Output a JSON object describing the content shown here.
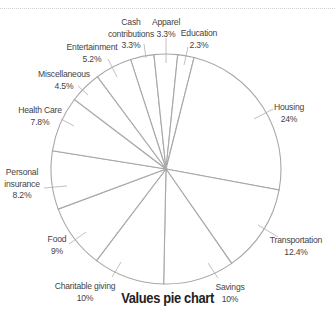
{
  "chart_data": {
    "type": "pie",
    "title": "Values pie chart",
    "start_angle_deg": -17.9,
    "direction": "clockwise",
    "slices": [
      {
        "label": "Cash contributions",
        "lines": [
          "Cash",
          "contributions",
          "3.3%"
        ],
        "value": 3.3,
        "text_x": 131,
        "text_y": 25,
        "leader": [
          [
            144,
            44
          ],
          [
            146,
            58
          ]
        ]
      },
      {
        "label": "Apparel",
        "lines": [
          "Apparel",
          "3.3%"
        ],
        "value": 3.3,
        "text_x": 166,
        "text_y": 25,
        "leader": [
          [
            166,
            38
          ],
          [
            166,
            63
          ]
        ]
      },
      {
        "label": "Education",
        "lines": [
          "Education",
          "2.3%"
        ],
        "value": 2.3,
        "text_x": 199,
        "text_y": 36,
        "leader": [
          [
            188,
            47
          ],
          [
            184,
            65
          ]
        ]
      },
      {
        "label": "Housing",
        "lines": [
          "Housing",
          "24%"
        ],
        "value": 24,
        "text_x": 289,
        "text_y": 110,
        "leader": [
          [
            273,
            109
          ],
          [
            254,
            119
          ]
        ]
      },
      {
        "label": "Transportation",
        "lines": [
          "Transportation",
          "12.4%"
        ],
        "value": 12.4,
        "text_x": 296,
        "text_y": 243,
        "leader": [
          [
            278,
            237
          ],
          [
            258,
            225
          ]
        ]
      },
      {
        "label": "Savings",
        "lines": [
          "Savings",
          "10%"
        ],
        "value": 10,
        "text_x": 230,
        "text_y": 290,
        "leader": [
          [
            218,
            278
          ],
          [
            208,
            263
          ]
        ]
      },
      {
        "label": "Charitable giving",
        "lines": [
          "Charitable giving",
          "10%"
        ],
        "value": 10,
        "text_x": 85,
        "text_y": 289,
        "leader": [
          [
            112,
            277
          ],
          [
            121,
            262
          ]
        ]
      },
      {
        "label": "Food",
        "lines": [
          "Food",
          "9%"
        ],
        "value": 9,
        "text_x": 57,
        "text_y": 242,
        "leader": [
          [
            69,
            244
          ],
          [
            86,
            232
          ]
        ]
      },
      {
        "label": "Personal insurance",
        "lines": [
          "Personal",
          "insurance",
          "8.2%"
        ],
        "value": 8.2,
        "text_x": 22,
        "text_y": 175,
        "leader": [
          [
            44,
            188
          ],
          [
            67,
            186
          ]
        ]
      },
      {
        "label": "Health Care",
        "lines": [
          "Health Care",
          "7.8%"
        ],
        "value": 7.8,
        "text_x": 40,
        "text_y": 113,
        "leader": [
          [
            61,
            119
          ],
          [
            74,
            126
          ]
        ]
      },
      {
        "label": "Miscellaneous",
        "lines": [
          "Miscellaneous",
          "4.5%"
        ],
        "value": 4.5,
        "text_x": 64,
        "text_y": 77,
        "leader": [
          [
            78,
            86
          ],
          [
            88,
            95
          ]
        ]
      },
      {
        "label": "Entertainment",
        "lines": [
          "Entertainment",
          "5.2%"
        ],
        "value": 5.2,
        "text_x": 92,
        "text_y": 50,
        "leader": [
          [
            108,
            59
          ],
          [
            117,
            77
          ]
        ]
      }
    ],
    "center": [
      166,
      169
    ],
    "radius": 115,
    "stroke_color": "#a8a8a8",
    "fill_color": "#ffffff",
    "label_color": "#444444",
    "legend": "none"
  }
}
